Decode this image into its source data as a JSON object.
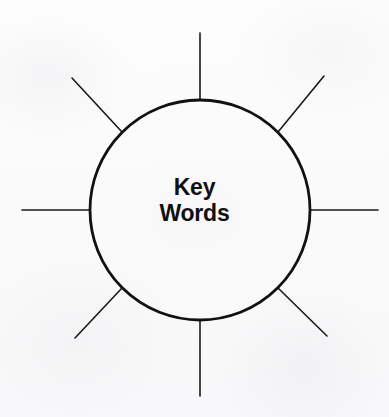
{
  "diagram": {
    "type": "word-web-graphic-organizer",
    "center": {
      "shape": "circle",
      "label_lines": [
        "Key",
        "Words"
      ],
      "cx": 200,
      "cy": 210,
      "r": 110,
      "stroke_color": "#111111",
      "stroke_width": 2.8,
      "fill_color": "none",
      "text_color": "#101010"
    },
    "background_color": "#fbfbfc",
    "spokes": [
      {
        "name": "spoke-n",
        "angle_deg": 90,
        "label": "",
        "x1": 200,
        "y1": 100,
        "x2": 200,
        "y2": 33
      },
      {
        "name": "spoke-ne",
        "angle_deg": 45,
        "label": "",
        "x1": 278,
        "y1": 132,
        "x2": 324,
        "y2": 76
      },
      {
        "name": "spoke-e",
        "angle_deg": 0,
        "label": "",
        "x1": 310,
        "y1": 210,
        "x2": 378,
        "y2": 210
      },
      {
        "name": "spoke-se",
        "angle_deg": 315,
        "label": "",
        "x1": 278,
        "y1": 288,
        "x2": 327,
        "y2": 336
      },
      {
        "name": "spoke-s",
        "angle_deg": 270,
        "label": "",
        "x1": 200,
        "y1": 320,
        "x2": 200,
        "y2": 396
      },
      {
        "name": "spoke-sw",
        "angle_deg": 225,
        "label": "",
        "x1": 122,
        "y1": 288,
        "x2": 75,
        "y2": 338
      },
      {
        "name": "spoke-w",
        "angle_deg": 180,
        "label": "",
        "x1": 90,
        "y1": 210,
        "x2": 22,
        "y2": 210
      },
      {
        "name": "spoke-nw",
        "angle_deg": 135,
        "label": "",
        "x1": 122,
        "y1": 132,
        "x2": 72,
        "y2": 78
      }
    ],
    "spoke_stroke_color": "#1a1a1a",
    "spoke_stroke_width": 1.6,
    "spoke_count": 8
  }
}
